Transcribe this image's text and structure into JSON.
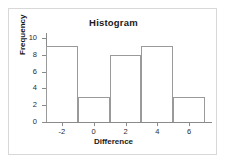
{
  "chart_data": {
    "type": "bar",
    "title": "Histogram",
    "xlabel": "Difference",
    "ylabel": "Frequency",
    "categories": [
      "-3 to -1",
      "-1 to 1",
      "1 to 3",
      "3 to 5",
      "5 to 7"
    ],
    "bin_edges": [
      -3,
      -1,
      1,
      3,
      5,
      7
    ],
    "values": [
      9,
      3,
      8,
      9,
      3
    ],
    "xlim": [
      -3,
      7
    ],
    "ylim": [
      0,
      10
    ],
    "x_ticks": [
      -2,
      0,
      2,
      4,
      6
    ],
    "x_tick_labels": [
      "-2",
      "0",
      "2",
      "4",
      "6"
    ],
    "y_ticks": [
      0,
      2,
      4,
      6,
      8,
      10
    ],
    "y_tick_labels": [
      "0",
      "2",
      "4",
      "6",
      "8",
      "10"
    ],
    "grid": false,
    "legend": null,
    "bar_fill_color": "#ffffff",
    "bar_edge_color": "#9a9a9a",
    "axis_color": "#8a8a8a",
    "text_color": "#1a1a1a",
    "frame_color": "#d8d8d8",
    "background_color": "#ffffff"
  }
}
